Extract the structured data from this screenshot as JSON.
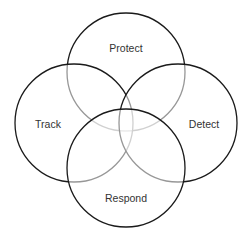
{
  "diagram": {
    "type": "venn",
    "colors": {
      "stroke": "#1a1a1a",
      "text": "#333333",
      "background": "#ffffff"
    },
    "circles": [
      {
        "id": "protect",
        "label": "Protect",
        "cx": 126,
        "cy": 72,
        "r": 59,
        "label_x": 126,
        "label_y": 48
      },
      {
        "id": "track",
        "label": "Track",
        "cx": 74,
        "cy": 123,
        "r": 59,
        "label_x": 48,
        "label_y": 124
      },
      {
        "id": "detect",
        "label": "Detect",
        "cx": 178,
        "cy": 123,
        "r": 59,
        "label_x": 204,
        "label_y": 124
      },
      {
        "id": "respond",
        "label": "Respond",
        "cx": 126,
        "cy": 168,
        "r": 59,
        "label_x": 126,
        "label_y": 198
      }
    ]
  }
}
